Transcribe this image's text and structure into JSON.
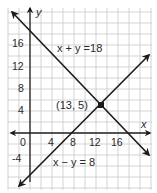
{
  "chart_data": {
    "type": "line",
    "title": "",
    "xlabel": "x",
    "ylabel": "y",
    "xlim": [
      -4,
      21
    ],
    "ylim": [
      -8,
      22
    ],
    "grid": true,
    "grid_step": 2,
    "x_ticks": [
      0,
      4,
      8,
      12,
      16
    ],
    "y_ticks": [
      -4,
      4,
      8,
      12,
      16
    ],
    "x_tick_labels": [
      "0",
      "4",
      "8",
      "12",
      "16"
    ],
    "y_tick_labels": [
      "-4",
      "4",
      "8",
      "12",
      "16"
    ],
    "series": [
      {
        "name": "x + y = 18",
        "equation": "x + y = 18",
        "slope": -1,
        "intercept": 18,
        "x": [
          -3.5,
          21.5
        ],
        "y": [
          21.5,
          -3.5
        ]
      },
      {
        "name": "x − y = 8",
        "equation": "x - y = 8",
        "slope": 1,
        "intercept": -8,
        "x": [
          -2,
          21.5
        ],
        "y": [
          -10,
          13.5
        ]
      }
    ],
    "annotations": [
      {
        "text": "x + y =18",
        "target": "line-1"
      },
      {
        "text": "x − y = 8",
        "target": "line-2"
      },
      {
        "text": "(13, 5)",
        "point": [
          13,
          5
        ]
      }
    ],
    "points": [
      {
        "x": 13,
        "y": 5,
        "label": "(13, 5)"
      }
    ]
  },
  "labels": {
    "x_axis": "x",
    "y_axis": "y",
    "line1": "x + y =18",
    "line2": "x − y = 8",
    "intersection": "(13, 5)",
    "origin": "0",
    "xt4": "4",
    "xt8": "8",
    "xt12": "12",
    "xt16": "16",
    "yt16": "16",
    "yt12": "12",
    "yt8": "8",
    "yt4": "4",
    "ytm4": "-4"
  }
}
